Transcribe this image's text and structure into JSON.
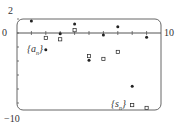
{
  "chart_data": {
    "type": "scatter",
    "title": "",
    "xlabel": "",
    "ylabel": "",
    "xlim": [
      0,
      10
    ],
    "ylim": [
      -10,
      2
    ],
    "x_tick_labels": [
      "0",
      "10"
    ],
    "y_tick_labels": [
      "2",
      "0",
      "-10"
    ],
    "grid": false,
    "legend": "inline labels",
    "series": [
      {
        "name": "{a_n}",
        "marker": "filled-dot",
        "x": [
          1,
          2,
          3,
          4,
          5,
          6,
          7,
          8,
          9
        ],
        "values": [
          1.7,
          -2.4,
          -0.1,
          1.3,
          -3.9,
          -0.3,
          0.9,
          -7.6,
          -0.6
        ]
      },
      {
        "name": "{s_n}",
        "marker": "open-square",
        "x": [
          1,
          2,
          3,
          4,
          5,
          6,
          7,
          8,
          9
        ],
        "values": [
          1.7,
          -0.7,
          -0.9,
          0.4,
          -3.3,
          -3.7,
          -2.7,
          -10.3,
          -10.7
        ]
      }
    ]
  },
  "labels": {
    "y_top": "2",
    "y_zero": "0",
    "y_bottom": "−10",
    "x_right": "10",
    "series_a_base": "a",
    "series_a_sub": "n",
    "series_s_base": "s",
    "series_s_sub": "n"
  },
  "colors": {
    "axis": "#555555",
    "frame": "#666666",
    "marker": "#222222"
  }
}
